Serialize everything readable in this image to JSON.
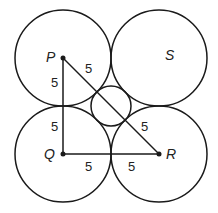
{
  "diagram": {
    "points": {
      "P": {
        "label": "P"
      },
      "Q": {
        "label": "Q"
      },
      "R": {
        "label": "R"
      },
      "S": {
        "label": "S"
      }
    },
    "segment_labels": {
      "PR_upper": "5",
      "PQ_upper": "5",
      "PQ_lower": "5",
      "QR_left": "5",
      "QR_right": "5",
      "PR_lower": "5"
    },
    "colors": {
      "stroke": "#1a1a1a",
      "background": "#ffffff"
    }
  }
}
